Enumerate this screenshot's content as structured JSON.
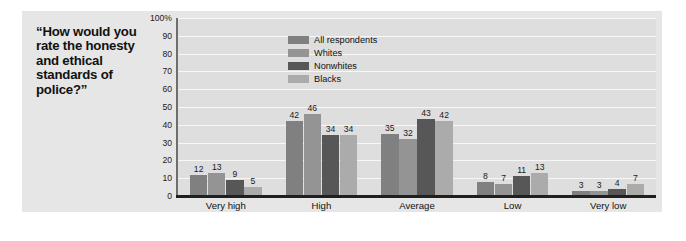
{
  "title": "“How would you rate the honesty and ethical standards of police?”",
  "legend": {
    "position": "top-left-inside",
    "items": [
      {
        "label": "All respondents",
        "color": "#808080"
      },
      {
        "label": "Whites",
        "color": "#949494"
      },
      {
        "label": "Nonwhites",
        "color": "#575757"
      },
      {
        "label": "Blacks",
        "color": "#ababab"
      }
    ]
  },
  "axis": {
    "y_ticks": [
      "100%",
      "90",
      "80",
      "70",
      "60",
      "50",
      "40",
      "30",
      "20",
      "10",
      "0"
    ]
  },
  "colors": {
    "page_background": "#ffffff",
    "panel_background": "#e6e6e6",
    "plot_background": "#dedede",
    "gridline": "#f7f7f7",
    "axis_spine": "#6e6e6e",
    "baseline": "#1f1f1f",
    "text": "#111111"
  },
  "chart_data": {
    "type": "bar",
    "title": "“How would you rate the honesty and ethical standards of police?”",
    "xlabel": "",
    "ylabel": "",
    "ylim": [
      0,
      100
    ],
    "ytick_values": [
      0,
      10,
      20,
      30,
      40,
      50,
      60,
      70,
      80,
      90,
      100
    ],
    "grid": true,
    "legend_position": "top-left-inside",
    "categories": [
      "Very high",
      "High",
      "Average",
      "Low",
      "Very low"
    ],
    "series": [
      {
        "name": "All respondents",
        "color": "#808080",
        "values": [
          12,
          42,
          35,
          8,
          3
        ]
      },
      {
        "name": "Whites",
        "color": "#949494",
        "values": [
          13,
          46,
          32,
          7,
          3
        ]
      },
      {
        "name": "Nonwhites",
        "color": "#575757",
        "values": [
          9,
          34,
          43,
          11,
          4
        ]
      },
      {
        "name": "Blacks",
        "color": "#ababab",
        "values": [
          5,
          34,
          42,
          13,
          7
        ]
      }
    ]
  }
}
